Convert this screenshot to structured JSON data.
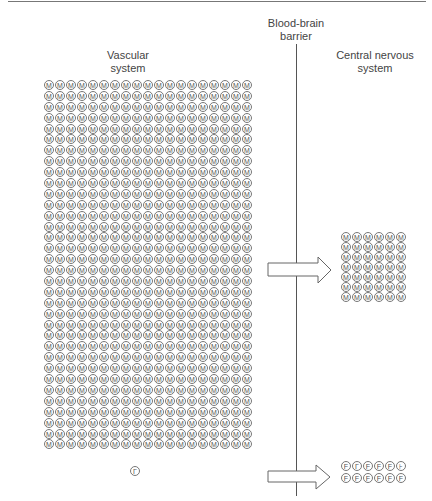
{
  "labels": {
    "vascular": [
      "Vascular",
      "system"
    ],
    "barrier": [
      "Blood-brain",
      "barrier"
    ],
    "cns": [
      "Central nervous",
      "system"
    ]
  },
  "vascular_grid": {
    "glyph": "M",
    "columns": 19,
    "rows": 34
  },
  "cns_grid": {
    "glyph": "M",
    "columns": 6,
    "rows": 7
  },
  "lone_molecule": {
    "glyph": "Γ"
  },
  "cns_f_grid": {
    "columns": 6,
    "rows": 2,
    "glyphs": [
      "F",
      "Γ",
      "F",
      "F",
      "F",
      "⊦",
      "F",
      "F",
      "F",
      "F",
      "F",
      "F"
    ]
  },
  "colors": {
    "stroke": "#777777",
    "text": "#444444",
    "barrier": "#555555"
  }
}
